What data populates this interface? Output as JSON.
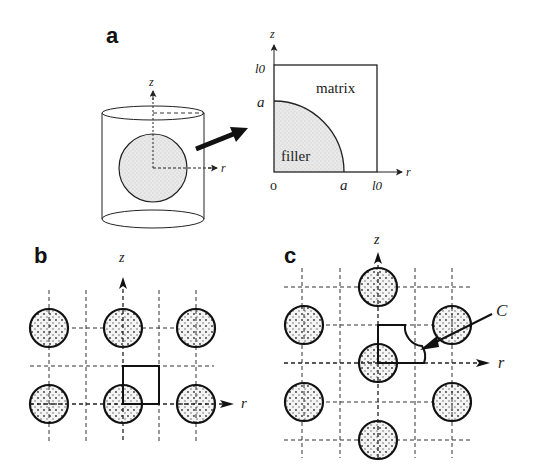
{
  "figure": {
    "panels": {
      "a": {
        "label": "a",
        "cylinder_axes": {
          "z": "z",
          "r": "r"
        },
        "unit_cell": {
          "z_axis": "z",
          "r_axis": "r",
          "origin": "o",
          "tick_l0_z": "l0",
          "tick_a_z": "a",
          "tick_a_r": "a",
          "tick_l0_r": "l0",
          "region_matrix": "matrix",
          "region_filler": "filler"
        }
      },
      "b": {
        "label": "b",
        "z_axis": "z",
        "r_axis": "r",
        "arrangement": "simple square array, 3 x 2 circles shown"
      },
      "c": {
        "label": "c",
        "z_axis": "z",
        "r_axis": "r",
        "callout": "C",
        "arrangement": "staggered array, 7 circles shown"
      }
    },
    "colors": {
      "ink": "#222222",
      "filler_fill": "#e6e6e6",
      "background": "#ffffff"
    }
  }
}
